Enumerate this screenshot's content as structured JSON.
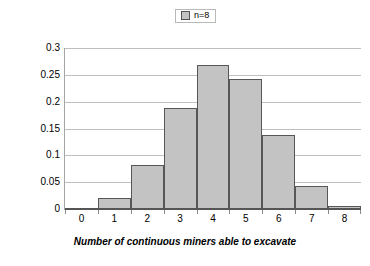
{
  "chart_data": {
    "type": "bar",
    "title": "",
    "subtitle": "",
    "xlabel": "Number of continuous miners able to excavate",
    "ylabel": "Probability",
    "categories": [
      "0",
      "1",
      "2",
      "3",
      "4",
      "5",
      "6",
      "7",
      "8"
    ],
    "values": [
      0.0,
      0.021,
      0.082,
      0.188,
      0.268,
      0.243,
      0.138,
      0.043,
      0.005
    ],
    "series": [
      {
        "name": "n=8",
        "values": [
          0.0,
          0.021,
          0.082,
          0.188,
          0.268,
          0.243,
          0.138,
          0.043,
          0.005
        ]
      }
    ],
    "ylim": [
      0,
      0.3
    ],
    "ytick_labels": [
      "0",
      "0.05",
      "0.1",
      "0.15",
      "0.2",
      "0.25",
      "0.3"
    ],
    "ytick_values": [
      0,
      0.05,
      0.1,
      0.15,
      0.2,
      0.25,
      0.3
    ],
    "grid": true,
    "grid_axis": "y",
    "legend": {
      "position": "top-center",
      "entries": [
        {
          "label": "n=8",
          "color": "#c3c3c3"
        }
      ]
    },
    "colors": {
      "bar_fill": "#c3c3c3",
      "bar_border": "#575757",
      "gridline": "#bfbfbf",
      "axis": "#555555",
      "text": "#000000",
      "background": "#ffffff"
    }
  },
  "legend": {
    "swatch_name": "legend-swatch",
    "label": "n=8"
  },
  "axes": {
    "y_title": "Probability",
    "x_title": "Number of continuous miners able to excavate"
  }
}
